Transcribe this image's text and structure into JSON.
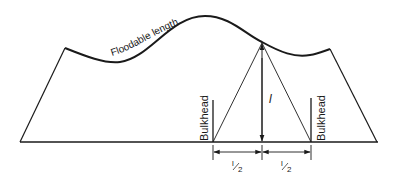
{
  "diagram": {
    "curve_label": "Floodable length",
    "bulkhead_left_label": "Bulkhead",
    "bulkhead_right_label": "Bulkhead",
    "height_label": "l",
    "half_left_num": "l",
    "half_left_den": "2",
    "half_right_num": "l",
    "half_right_den": "2",
    "colors": {
      "line": "#1a1a1a",
      "background": "#ffffff"
    }
  }
}
